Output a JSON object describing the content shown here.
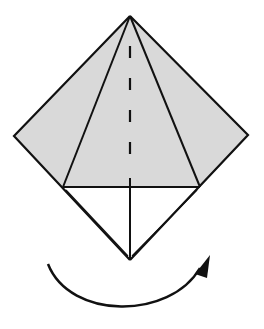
{
  "diagram": {
    "type": "origami-step",
    "colors": {
      "background": "#ffffff",
      "paper_colored": "#d9d9d9",
      "paper_white": "#ffffff",
      "line": "#111111"
    },
    "points": {
      "apex": [
        130,
        16
      ],
      "left_corner": [
        14,
        136
      ],
      "right_corner": [
        248,
        135
      ],
      "left_flap_bottom": [
        63,
        187
      ],
      "right_flap_bottom": [
        200,
        187
      ],
      "bottom": [
        130,
        260
      ]
    },
    "arrow": {
      "meaning": "turn-over",
      "start": [
        48,
        264
      ],
      "end": [
        210,
        258
      ]
    }
  }
}
